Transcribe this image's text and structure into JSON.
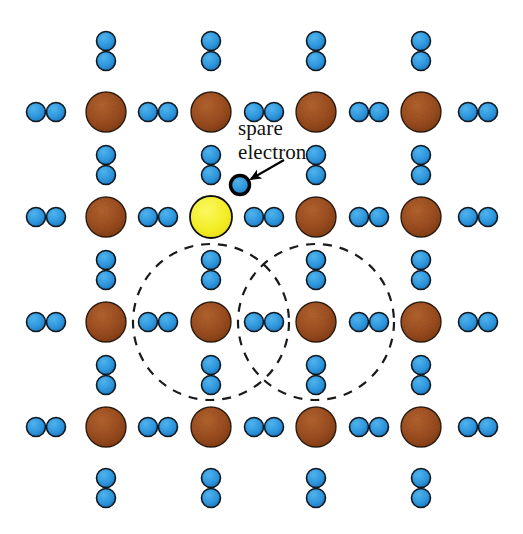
{
  "figure": {
    "name": "n-type-doped-semiconductor-lattice",
    "width": 523,
    "height": 534,
    "background_color": "#FFFFFF"
  },
  "colors": {
    "host_atom_fill": "#A0522D",
    "host_atom_fill_dark": "#7B3A12",
    "host_atom_stroke": "#2B1A08",
    "dopant_atom_fill": "#F5F02A",
    "dopant_atom_stroke": "#111111",
    "electron_fill": "#2E9BE0",
    "electron_fill_dark": "#1B6FB5",
    "electron_stroke": "#101820",
    "spare_electron_stroke": "#000000",
    "orbit_stroke": "#1A1A1A",
    "label_color": "#111111",
    "arrow_color": "#000000"
  },
  "geometry": {
    "atom_radius": 20,
    "dopant_radius": 21,
    "electron_radius": 9.5,
    "spare_electron_radius": 9.5,
    "spare_electron_stroke_width": 3.4,
    "atom_stroke_width": 1.4,
    "electron_stroke_width": 1.6,
    "orbit_radius": 78,
    "orbit_stroke_width": 2.2,
    "orbit_dash": "9 8",
    "column_x": [
      106,
      211,
      316,
      421
    ],
    "row_y": [
      112,
      217,
      322,
      427
    ],
    "edge_pair_left_x": 46,
    "edge_pair_right_x": 478,
    "pair_gap": 20
  },
  "annotation": {
    "label_line_1": "spare",
    "label_line_2": "electron",
    "label_x": 238,
    "label_line_1_y": 135,
    "label_line_2_y": 159,
    "arrow_tail_x": 284,
    "arrow_tail_y": 160,
    "arrow_head_x": 251,
    "arrow_head_y": 179,
    "spare_electron_x": 240,
    "spare_electron_y": 185
  },
  "host_atoms": [
    {
      "id": "atom-r1-c1",
      "x": 106,
      "y": 112
    },
    {
      "id": "atom-r1-c2",
      "x": 211,
      "y": 112
    },
    {
      "id": "atom-r1-c3",
      "x": 316,
      "y": 112
    },
    {
      "id": "atom-r1-c4",
      "x": 421,
      "y": 112
    },
    {
      "id": "atom-r2-c1",
      "x": 106,
      "y": 217
    },
    {
      "id": "atom-r2-c3",
      "x": 316,
      "y": 217
    },
    {
      "id": "atom-r2-c4",
      "x": 421,
      "y": 217
    },
    {
      "id": "atom-r3-c1",
      "x": 106,
      "y": 322
    },
    {
      "id": "atom-r3-c2",
      "x": 211,
      "y": 322
    },
    {
      "id": "atom-r3-c3",
      "x": 316,
      "y": 322
    },
    {
      "id": "atom-r3-c4",
      "x": 421,
      "y": 322
    },
    {
      "id": "atom-r4-c1",
      "x": 106,
      "y": 427
    },
    {
      "id": "atom-r4-c2",
      "x": 211,
      "y": 427
    },
    {
      "id": "atom-r4-c3",
      "x": 316,
      "y": 427
    },
    {
      "id": "atom-r4-c4",
      "x": 421,
      "y": 427
    }
  ],
  "dopant_atoms": [
    {
      "id": "dopant-r2-c2",
      "x": 211,
      "y": 217
    }
  ],
  "horizontal_electron_pairs": [
    {
      "id": "hpair-r1-left-edge",
      "x": 46,
      "y": 112
    },
    {
      "id": "hpair-r1-c1c2",
      "x": 158,
      "y": 112
    },
    {
      "id": "hpair-r1-c2c3",
      "x": 264,
      "y": 112
    },
    {
      "id": "hpair-r1-c3c4",
      "x": 369,
      "y": 112
    },
    {
      "id": "hpair-r1-right-edge",
      "x": 478,
      "y": 112
    },
    {
      "id": "hpair-r2-left-edge",
      "x": 46,
      "y": 217
    },
    {
      "id": "hpair-r2-c1c2",
      "x": 158,
      "y": 217
    },
    {
      "id": "hpair-r2-c2c3",
      "x": 264,
      "y": 217
    },
    {
      "id": "hpair-r2-c3c4",
      "x": 369,
      "y": 217
    },
    {
      "id": "hpair-r2-right-edge",
      "x": 478,
      "y": 217
    },
    {
      "id": "hpair-r3-left-edge",
      "x": 46,
      "y": 322
    },
    {
      "id": "hpair-r3-c1c2",
      "x": 158,
      "y": 322
    },
    {
      "id": "hpair-r3-c2c3",
      "x": 264,
      "y": 322
    },
    {
      "id": "hpair-r3-c3c4",
      "x": 369,
      "y": 322
    },
    {
      "id": "hpair-r3-right-edge",
      "x": 478,
      "y": 322
    },
    {
      "id": "hpair-r4-left-edge",
      "x": 46,
      "y": 427
    },
    {
      "id": "hpair-r4-c1c2",
      "x": 158,
      "y": 427
    },
    {
      "id": "hpair-r4-c2c3",
      "x": 264,
      "y": 427
    },
    {
      "id": "hpair-r4-c3c4",
      "x": 369,
      "y": 427
    },
    {
      "id": "hpair-r4-right-edge",
      "x": 478,
      "y": 427
    }
  ],
  "vertical_electron_pairs": [
    {
      "id": "vpair-top-c1",
      "x": 106,
      "y": 51
    },
    {
      "id": "vpair-top-c2",
      "x": 211,
      "y": 51
    },
    {
      "id": "vpair-top-c3",
      "x": 316,
      "y": 51
    },
    {
      "id": "vpair-top-c4",
      "x": 421,
      "y": 51
    },
    {
      "id": "vpair-r1r2-c1",
      "x": 106,
      "y": 165
    },
    {
      "id": "vpair-r1r2-c2",
      "x": 211,
      "y": 165
    },
    {
      "id": "vpair-r1r2-c3",
      "x": 316,
      "y": 165
    },
    {
      "id": "vpair-r1r2-c4",
      "x": 421,
      "y": 165
    },
    {
      "id": "vpair-r2r3-c1",
      "x": 106,
      "y": 270
    },
    {
      "id": "vpair-r2r3-c2",
      "x": 211,
      "y": 270
    },
    {
      "id": "vpair-r2r3-c3",
      "x": 316,
      "y": 270
    },
    {
      "id": "vpair-r2r3-c4",
      "x": 421,
      "y": 270
    },
    {
      "id": "vpair-r3r4-c1",
      "x": 106,
      "y": 375
    },
    {
      "id": "vpair-r3r4-c2",
      "x": 211,
      "y": 375
    },
    {
      "id": "vpair-r3r4-c3",
      "x": 316,
      "y": 375
    },
    {
      "id": "vpair-r3r4-c4",
      "x": 421,
      "y": 375
    },
    {
      "id": "vpair-bottom-c1",
      "x": 106,
      "y": 488
    },
    {
      "id": "vpair-bottom-c2",
      "x": 211,
      "y": 488
    },
    {
      "id": "vpair-bottom-c3",
      "x": 316,
      "y": 488
    },
    {
      "id": "vpair-bottom-c4",
      "x": 421,
      "y": 488
    }
  ],
  "orbits": [
    {
      "id": "orbit-left",
      "x": 211,
      "y": 322,
      "r": 78
    },
    {
      "id": "orbit-right",
      "x": 316,
      "y": 322,
      "r": 78
    }
  ]
}
